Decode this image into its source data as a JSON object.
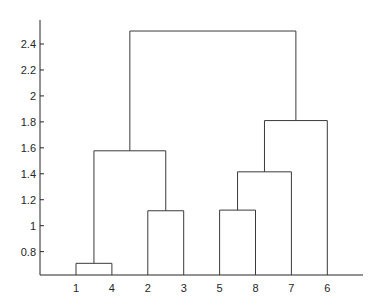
{
  "chart_data": {
    "type": "dendrogram",
    "title": "",
    "xlabel": "",
    "ylabel": "",
    "ylim": [
      0.62,
      2.585
    ],
    "grid": false,
    "yticks": [
      0.8,
      1,
      1.2,
      1.4,
      1.6,
      1.8,
      2,
      2.2,
      2.4
    ],
    "ytick_labels": [
      "0.8",
      "1",
      "1.2",
      "1.4",
      "1.6",
      "1.8",
      "2",
      "2.2",
      "2.4"
    ],
    "leaf_order": [
      "1",
      "4",
      "2",
      "3",
      "5",
      "8",
      "7",
      "6"
    ],
    "links": [
      {
        "id": "c9",
        "left": "1",
        "right": "4",
        "height": 0.71
      },
      {
        "id": "c10",
        "left": "2",
        "right": "3",
        "height": 1.115
      },
      {
        "id": "c11",
        "left": "5",
        "right": "8",
        "height": 1.12
      },
      {
        "id": "c12",
        "left": "c11",
        "right": "7",
        "height": 1.415
      },
      {
        "id": "c13",
        "left": "c9",
        "right": "c10",
        "height": 1.577
      },
      {
        "id": "c14",
        "left": "c12",
        "right": "6",
        "height": 1.81
      },
      {
        "id": "c15",
        "left": "c13",
        "right": "c14",
        "height": 2.5
      }
    ]
  }
}
